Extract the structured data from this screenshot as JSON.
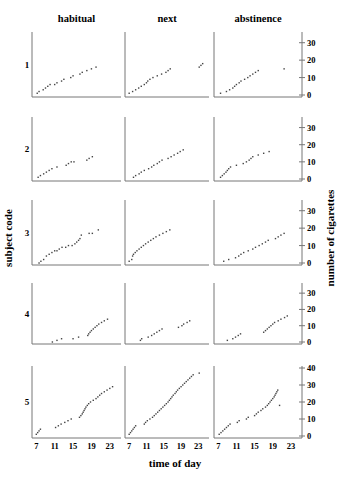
{
  "chart_data": {
    "type": "scatter",
    "layout": "small-multiples grid 5 rows x 3 columns",
    "columns": [
      "habitual",
      "next",
      "abstinence"
    ],
    "rows": [
      "1",
      "2",
      "3",
      "4",
      "5"
    ],
    "xlabel": "time of day",
    "ylabel_left": "subject code",
    "ylabel_right": "number of cigarettes",
    "x_ticks": [
      7,
      11,
      15,
      19,
      23
    ],
    "xlim": [
      6.5,
      25
    ],
    "y_ticks_rows_1_4": [
      0,
      10,
      20,
      30
    ],
    "ylim_rows_1_4": [
      0,
      35
    ],
    "y_ticks_row_5": [
      0,
      10,
      20,
      30,
      40
    ],
    "ylim_row_5": [
      0,
      40
    ],
    "grid": false,
    "legend": "none",
    "panels": [
      {
        "subject": "1",
        "condition": "habitual",
        "points": [
          [
            7.2,
            1
          ],
          [
            7.6,
            2
          ],
          [
            8.5,
            3
          ],
          [
            9,
            4
          ],
          [
            9.5,
            5
          ],
          [
            10,
            6
          ],
          [
            11,
            6
          ],
          [
            11.5,
            7
          ],
          [
            12.5,
            8
          ],
          [
            13,
            9
          ],
          [
            14.5,
            10
          ],
          [
            15,
            11
          ],
          [
            16.5,
            12
          ],
          [
            17,
            13
          ],
          [
            18,
            14
          ],
          [
            19,
            15
          ],
          [
            20,
            16
          ]
        ]
      },
      {
        "subject": "1",
        "condition": "next",
        "points": [
          [
            7,
            1
          ],
          [
            7.8,
            2
          ],
          [
            8.5,
            3
          ],
          [
            9.2,
            4
          ],
          [
            9.8,
            5
          ],
          [
            10.5,
            6
          ],
          [
            11,
            7
          ],
          [
            11.3,
            8
          ],
          [
            11.8,
            9
          ],
          [
            12.5,
            10
          ],
          [
            13.5,
            11
          ],
          [
            14.5,
            12
          ],
          [
            15.5,
            13
          ],
          [
            16,
            14
          ],
          [
            16.5,
            15
          ],
          [
            23.2,
            16
          ],
          [
            23.6,
            17
          ],
          [
            24,
            18
          ]
        ]
      },
      {
        "subject": "1",
        "condition": "abstinence",
        "points": [
          [
            7.5,
            1
          ],
          [
            8.8,
            2
          ],
          [
            9.5,
            3
          ],
          [
            10.2,
            4
          ],
          [
            10.6,
            5
          ],
          [
            11,
            6
          ],
          [
            11.6,
            7
          ],
          [
            12,
            8
          ],
          [
            12.8,
            9
          ],
          [
            13.5,
            10
          ],
          [
            14,
            11
          ],
          [
            14.6,
            12
          ],
          [
            15.2,
            13
          ],
          [
            15.8,
            14
          ],
          [
            21.5,
            15
          ]
        ]
      },
      {
        "subject": "2",
        "condition": "habitual",
        "points": [
          [
            7.4,
            1
          ],
          [
            7.9,
            2
          ],
          [
            8.6,
            3
          ],
          [
            9.2,
            4
          ],
          [
            9.8,
            5
          ],
          [
            10.4,
            6
          ],
          [
            11.5,
            7
          ],
          [
            13.5,
            8
          ],
          [
            14,
            9
          ],
          [
            14.6,
            10
          ],
          [
            15.2,
            10
          ],
          [
            18,
            11
          ],
          [
            18.5,
            12
          ],
          [
            19.2,
            13
          ]
        ]
      },
      {
        "subject": "2",
        "condition": "next",
        "points": [
          [
            8,
            1
          ],
          [
            8.5,
            2
          ],
          [
            9.3,
            3
          ],
          [
            9.8,
            4
          ],
          [
            10.5,
            5
          ],
          [
            11.5,
            6
          ],
          [
            12.2,
            7
          ],
          [
            12.7,
            8
          ],
          [
            13.5,
            9
          ],
          [
            14,
            10
          ],
          [
            14.6,
            11
          ],
          [
            16,
            12
          ],
          [
            16.7,
            13
          ],
          [
            17.4,
            14
          ],
          [
            18.2,
            15
          ],
          [
            18.8,
            16
          ],
          [
            19.5,
            17
          ]
        ]
      },
      {
        "subject": "2",
        "condition": "abstinence",
        "points": [
          [
            7.5,
            1
          ],
          [
            7.9,
            2
          ],
          [
            8.3,
            3
          ],
          [
            8.7,
            4
          ],
          [
            9,
            5
          ],
          [
            9.3,
            6
          ],
          [
            9.7,
            7
          ],
          [
            11,
            8
          ],
          [
            12.5,
            9
          ],
          [
            13.2,
            10
          ],
          [
            13.8,
            11
          ],
          [
            14.2,
            12
          ],
          [
            14.6,
            13
          ],
          [
            15.8,
            14
          ],
          [
            17,
            15
          ],
          [
            18.2,
            16
          ]
        ]
      },
      {
        "subject": "3",
        "condition": "habitual",
        "points": [
          [
            7.6,
            0
          ],
          [
            8,
            1
          ],
          [
            8.6,
            2
          ],
          [
            9.2,
            4
          ],
          [
            9.8,
            5
          ],
          [
            10.4,
            6
          ],
          [
            11,
            7
          ],
          [
            11.5,
            7
          ],
          [
            12,
            8
          ],
          [
            12.6,
            9
          ],
          [
            13.4,
            9
          ],
          [
            14,
            10
          ],
          [
            14.8,
            10
          ],
          [
            15.4,
            11
          ],
          [
            15.8,
            12
          ],
          [
            16.2,
            13
          ],
          [
            16.5,
            14
          ],
          [
            16.8,
            16
          ],
          [
            18.5,
            17
          ],
          [
            19.2,
            17
          ],
          [
            20.5,
            19
          ]
        ]
      },
      {
        "subject": "3",
        "condition": "next",
        "points": [
          [
            7,
            1
          ],
          [
            7.6,
            2
          ],
          [
            7.8,
            4
          ],
          [
            8,
            5
          ],
          [
            8.4,
            6
          ],
          [
            8.8,
            7
          ],
          [
            9.3,
            8
          ],
          [
            9.8,
            9
          ],
          [
            10.3,
            10
          ],
          [
            10.8,
            11
          ],
          [
            11.4,
            12
          ],
          [
            12,
            13
          ],
          [
            12.6,
            14
          ],
          [
            13.2,
            15
          ],
          [
            14,
            16
          ],
          [
            14.8,
            17
          ],
          [
            15.6,
            18
          ],
          [
            16.4,
            19
          ]
        ]
      },
      {
        "subject": "3",
        "condition": "abstinence",
        "points": [
          [
            8.2,
            1
          ],
          [
            9.3,
            2
          ],
          [
            10.8,
            3
          ],
          [
            11.5,
            4
          ],
          [
            12,
            5
          ],
          [
            12.6,
            6
          ],
          [
            13.6,
            7
          ],
          [
            14.6,
            8
          ],
          [
            15.2,
            9
          ],
          [
            16,
            10
          ],
          [
            16.7,
            11
          ],
          [
            17.4,
            12
          ],
          [
            18,
            13
          ],
          [
            19.6,
            14
          ],
          [
            20.2,
            15
          ],
          [
            20.8,
            16
          ],
          [
            21.5,
            17
          ]
        ]
      },
      {
        "subject": "4",
        "condition": "habitual",
        "points": [
          [
            10.5,
            0
          ],
          [
            11.5,
            1
          ],
          [
            12.5,
            2
          ],
          [
            15,
            2
          ],
          [
            16.2,
            3
          ],
          [
            18.2,
            4
          ],
          [
            18.4,
            5
          ],
          [
            18.7,
            6
          ],
          [
            19,
            7
          ],
          [
            19.4,
            8
          ],
          [
            19.8,
            9
          ],
          [
            20.2,
            10
          ],
          [
            20.6,
            11
          ],
          [
            21.2,
            12
          ],
          [
            21.8,
            13
          ],
          [
            22.5,
            14
          ]
        ]
      },
      {
        "subject": "4",
        "condition": "next",
        "points": [
          [
            9.6,
            1
          ],
          [
            9.9,
            2
          ],
          [
            11.4,
            3
          ],
          [
            12.2,
            4
          ],
          [
            12.8,
            5
          ],
          [
            13.4,
            6
          ],
          [
            14,
            7
          ],
          [
            14.6,
            8
          ],
          [
            18.4,
            9
          ],
          [
            19.2,
            10
          ],
          [
            19.6,
            11
          ],
          [
            20.4,
            12
          ],
          [
            21,
            13
          ]
        ]
      },
      {
        "subject": "4",
        "condition": "abstinence",
        "points": [
          [
            9,
            1
          ],
          [
            10.2,
            2
          ],
          [
            10.8,
            3
          ],
          [
            11.4,
            4
          ],
          [
            11.9,
            5
          ],
          [
            17,
            6
          ],
          [
            17.4,
            7
          ],
          [
            17.8,
            8
          ],
          [
            18.2,
            9
          ],
          [
            18.6,
            10
          ],
          [
            19,
            11
          ],
          [
            19.4,
            12
          ],
          [
            20.2,
            13
          ],
          [
            20.8,
            14
          ],
          [
            21.6,
            15
          ],
          [
            22.2,
            16
          ]
        ]
      },
      {
        "subject": "5",
        "condition": "habitual",
        "points": [
          [
            7,
            1
          ],
          [
            7.3,
            2
          ],
          [
            7.6,
            3
          ],
          [
            7.9,
            4
          ],
          [
            11.2,
            5
          ],
          [
            11.8,
            6
          ],
          [
            12.4,
            7
          ],
          [
            13.2,
            8
          ],
          [
            13.9,
            9
          ],
          [
            14.6,
            10
          ],
          [
            16.4,
            11
          ],
          [
            16.7,
            12
          ],
          [
            17,
            13
          ],
          [
            17.2,
            14
          ],
          [
            17.4,
            15
          ],
          [
            17.6,
            16
          ],
          [
            17.8,
            17
          ],
          [
            18.1,
            18
          ],
          [
            18.4,
            19
          ],
          [
            18.8,
            20
          ],
          [
            19.4,
            21
          ],
          [
            20,
            22
          ],
          [
            20.4,
            23
          ],
          [
            20.8,
            24
          ],
          [
            21.2,
            25
          ],
          [
            21.8,
            26
          ],
          [
            22.4,
            27
          ],
          [
            23,
            28
          ],
          [
            23.6,
            29
          ]
        ]
      },
      {
        "subject": "5",
        "condition": "next",
        "points": [
          [
            7,
            1
          ],
          [
            7.3,
            2
          ],
          [
            7.6,
            3
          ],
          [
            7.9,
            4
          ],
          [
            8.2,
            5
          ],
          [
            8.5,
            6
          ],
          [
            10.5,
            7
          ],
          [
            10.8,
            8
          ],
          [
            11.2,
            9
          ],
          [
            11.8,
            10
          ],
          [
            12.4,
            11
          ],
          [
            12.8,
            12
          ],
          [
            13.2,
            13
          ],
          [
            13.6,
            14
          ],
          [
            14,
            15
          ],
          [
            14.4,
            16
          ],
          [
            14.8,
            17
          ],
          [
            15.2,
            18
          ],
          [
            15.6,
            19
          ],
          [
            16,
            20
          ],
          [
            16.3,
            21
          ],
          [
            16.6,
            22
          ],
          [
            16.9,
            23
          ],
          [
            17.2,
            24
          ],
          [
            17.6,
            25
          ],
          [
            17.9,
            26
          ],
          [
            18.2,
            27
          ],
          [
            18.6,
            28
          ],
          [
            19,
            29
          ],
          [
            19.4,
            30
          ],
          [
            19.8,
            31
          ],
          [
            20.2,
            32
          ],
          [
            20.6,
            33
          ],
          [
            21,
            34
          ],
          [
            21.4,
            35
          ],
          [
            21.8,
            36
          ],
          [
            23.2,
            37
          ]
        ]
      },
      {
        "subject": "5",
        "condition": "abstinence",
        "points": [
          [
            7.2,
            1
          ],
          [
            7.6,
            2
          ],
          [
            8,
            3
          ],
          [
            8.4,
            4
          ],
          [
            8.8,
            5
          ],
          [
            9.2,
            6
          ],
          [
            9.6,
            7
          ],
          [
            11.2,
            8
          ],
          [
            11.6,
            9
          ],
          [
            13.2,
            10
          ],
          [
            13.6,
            11
          ],
          [
            15,
            12
          ],
          [
            15.4,
            13
          ],
          [
            15.8,
            14
          ],
          [
            16.4,
            15
          ],
          [
            16.8,
            16
          ],
          [
            17.4,
            17
          ],
          [
            17.8,
            18
          ],
          [
            18.1,
            19
          ],
          [
            18.4,
            20
          ],
          [
            18.7,
            21
          ],
          [
            19,
            22
          ],
          [
            19.3,
            23
          ],
          [
            19.5,
            24
          ],
          [
            19.7,
            25
          ],
          [
            19.9,
            26
          ],
          [
            20.1,
            27
          ],
          [
            20.5,
            18
          ]
        ]
      }
    ]
  },
  "labels": {
    "col_titles": [
      "habitual",
      "next",
      "abstinence"
    ],
    "row_labels": [
      "1",
      "2",
      "3",
      "4",
      "5"
    ],
    "x_title": "time of day",
    "y_left_title": "subject code",
    "y_right_title": "number of cigarettes"
  },
  "colors": {
    "axis": "#777777",
    "point": "#444444",
    "text": "#222222"
  }
}
